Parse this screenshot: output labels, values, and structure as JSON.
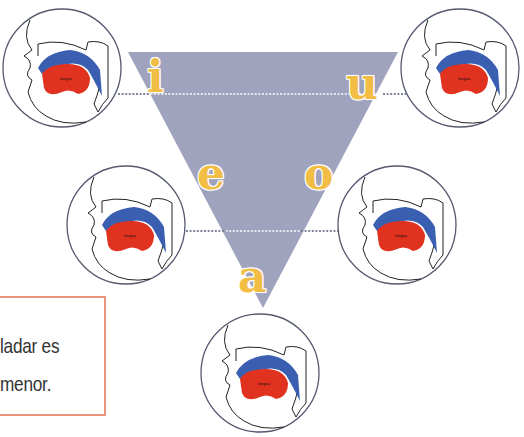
{
  "diagram": {
    "type": "vowel-triangle",
    "triangle_color": "#9fa3bd",
    "vowel_color": "#f2bd45",
    "tongue_color": "#e0321e",
    "palate_color": "#3a5fb0",
    "vowels": [
      {
        "id": "i",
        "label": "i",
        "position": "top-left"
      },
      {
        "id": "u",
        "label": "u",
        "position": "top-right"
      },
      {
        "id": "e",
        "label": "e",
        "position": "middle-left"
      },
      {
        "id": "o",
        "label": "o",
        "position": "middle-right"
      },
      {
        "id": "a",
        "label": "a",
        "position": "bottom"
      }
    ],
    "mouth_diagrams": [
      {
        "vowel": "i",
        "tongue_label": "lengua"
      },
      {
        "vowel": "u",
        "tongue_label": "lengua"
      },
      {
        "vowel": "e",
        "tongue_label": "lengua"
      },
      {
        "vowel": "o",
        "tongue_label": "lengua"
      },
      {
        "vowel": "a",
        "tongue_label": "lengua"
      }
    ]
  },
  "note": {
    "border_color": "#e8957a",
    "lines": [
      "ladar es",
      "menor."
    ]
  }
}
